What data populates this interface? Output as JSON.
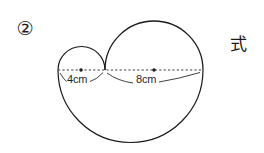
{
  "figure": {
    "problem_number": "②",
    "side_note": "式",
    "background_color": "#ffffff",
    "stroke_color": "#1a1a1a",
    "dash_color": "#3a3a3a",
    "labels": [
      {
        "id": "small-circle-diameter",
        "text": "4cm",
        "value": 4,
        "unit": "cm"
      },
      {
        "id": "large-circle-diameter",
        "text": "8cm",
        "value": 8,
        "unit": "cm"
      }
    ],
    "shapes": {
      "outer_semicircle": {
        "name": "outer-semicircle",
        "center_x": 130.5,
        "center_y": 70,
        "radius": 72.5,
        "diameter_cm": 12,
        "half": "bottom"
      },
      "large_semicircle": {
        "name": "large-upper-semicircle",
        "center_x": 154,
        "center_y": 70,
        "radius": 49,
        "diameter_cm": 8,
        "half": "top"
      },
      "small_semicircle": {
        "name": "small-upper-semicircle",
        "center_x": 81,
        "center_y": 70,
        "radius": 23.5,
        "diameter_cm": 4,
        "half": "top"
      },
      "diameter_line": {
        "name": "dashed-diameter-line",
        "x1": 58,
        "x2": 203,
        "y": 70,
        "style": "dashed"
      },
      "center_dots": [
        {
          "name": "small-circle-center-dot",
          "x": 81,
          "y": 70
        },
        {
          "name": "large-circle-center-dot",
          "x": 154,
          "y": 70
        }
      ]
    }
  }
}
